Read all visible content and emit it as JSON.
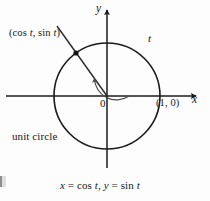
{
  "figure": {
    "background_color": "#fdfdfd",
    "stroke_color": "#1a1a1a",
    "thin_stroke_color": "#4a4a4a",
    "caption": "x = cos t, y = sin t",
    "labels": {
      "point": "(cos t, sin t)",
      "angle": "t",
      "origin": "0",
      "intercept": "(1, 0)",
      "axis_x": "x",
      "axis_y": "y",
      "curve_name": "unit circle"
    }
  },
  "chart_data": {
    "type": "scatter",
    "title": "",
    "subtitle": "",
    "caption": "x = cos t, y = sin t",
    "xlabel": "x",
    "ylabel": "y",
    "grid": false,
    "legend": "none",
    "xlim": [
      -1.4,
      1.4
    ],
    "ylim": [
      -1.3,
      1.5
    ],
    "annotations": [
      {
        "text": "(cos t, sin t)",
        "x": -1.25,
        "y": 1.1
      },
      {
        "text": "t",
        "x": 0.78,
        "y": 0.95
      },
      {
        "text": "0",
        "x": -0.08,
        "y": -0.13
      },
      {
        "text": "(1, 0)",
        "x": 1.05,
        "y": -0.14
      },
      {
        "text": "unit circle",
        "x": -1.3,
        "y": -0.7
      },
      {
        "text": "x",
        "x": 1.42,
        "y": -0.05
      },
      {
        "text": "y",
        "x": -0.11,
        "y": 1.45
      }
    ],
    "series": [
      {
        "name": "unit circle",
        "type": "parametric-curve",
        "equation": "x = cos t, y = sin t",
        "center": [
          0,
          0
        ],
        "radius": 1
      },
      {
        "name": "terminal ray",
        "type": "line",
        "from": [
          0,
          0
        ],
        "to": [
          -0.95,
          1.32
        ],
        "angle_degrees": 126
      },
      {
        "name": "point on circle",
        "type": "marker",
        "x": -0.59,
        "y": 0.81,
        "label": "(cos t, sin t)",
        "angle_degrees": 126
      },
      {
        "name": "angle arc",
        "type": "arc",
        "radius": 0.42,
        "start_degrees": 0,
        "end_degrees": 126,
        "direction": "counterclockwise",
        "label": "t"
      }
    ],
    "axes": {
      "x_axis": {
        "from": [
          -1.4,
          0
        ],
        "to": [
          1.42,
          0
        ],
        "arrow": "end"
      },
      "y_axis": {
        "from": [
          0,
          -1.1
        ],
        "to": [
          0,
          1.45
        ],
        "arrow": "end"
      }
    }
  }
}
